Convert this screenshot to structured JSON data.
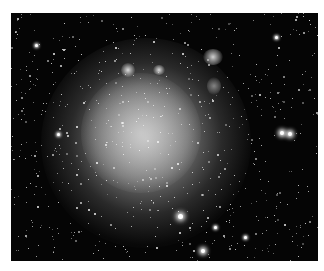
{
  "image": {
    "subject": "irregular dwarf galaxy star field",
    "background_color": "#050505",
    "galaxy_core_color": "#c8c8c8",
    "description": "Grayscale astronomical photograph of a diffuse irregular galaxy surrounded by a dense field of stars"
  }
}
